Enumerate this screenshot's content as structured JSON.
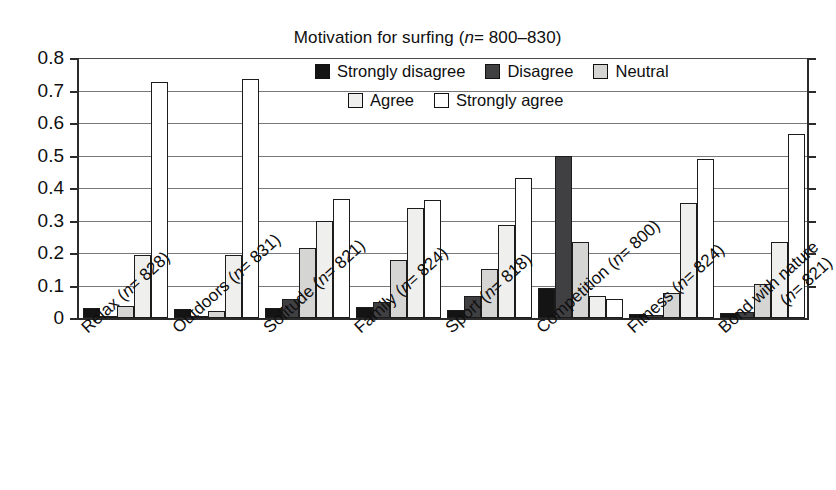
{
  "chart_data": {
    "type": "bar",
    "title_prefix": "Motivation for surfing (",
    "title_n": "n",
    "title_suffix": "= 800–830)",
    "xlabel": "",
    "ylabel": "",
    "ylim": [
      0,
      0.8
    ],
    "ytick_values": [
      0,
      0.1,
      0.2,
      0.3,
      0.4,
      0.5,
      0.6,
      0.7,
      0.8
    ],
    "ytick_labels": [
      "0",
      "0.1",
      "0.2",
      "0.3",
      "0.4",
      "0.5",
      "0.6",
      "0.7",
      "0.8"
    ],
    "grid": true,
    "grid_axis": "y",
    "legend_position": "upper right inside",
    "categories": [
      "Relax (n= 828)",
      "Outdoors (n= 831)",
      "Solitude (n= 821)",
      "Family (n= 824)",
      "Sport (n= 818)",
      "Competition (n= 800)",
      "Fitness (n= 824)",
      "Bond with nature (n= 821)"
    ],
    "category_parts": [
      {
        "name": "Relax",
        "n": "828",
        "line2": ""
      },
      {
        "name": "Outdoors",
        "n": "831",
        "line2": ""
      },
      {
        "name": "Solitude",
        "n": "821",
        "line2": ""
      },
      {
        "name": "Family",
        "n": "824",
        "line2": ""
      },
      {
        "name": "Sport",
        "n": "818",
        "line2": ""
      },
      {
        "name": "Competition",
        "n": "800",
        "line2": ""
      },
      {
        "name": "Fitness",
        "n": "824",
        "line2": ""
      },
      {
        "name": "Bond with nature",
        "n": "821",
        "line2": "wrapped"
      }
    ],
    "series": [
      {
        "name": "Strongly disagree",
        "color": "#141414",
        "values": [
          0.03,
          0.028,
          0.03,
          0.033,
          0.025,
          0.092,
          0.013,
          0.015
        ]
      },
      {
        "name": "Disagree",
        "color": "#404043",
        "values": [
          0.006,
          0.004,
          0.058,
          0.048,
          0.068,
          0.5,
          0.008,
          0.018
        ]
      },
      {
        "name": "Neutral",
        "color": "#d5d5d3",
        "values": [
          0.036,
          0.022,
          0.215,
          0.178,
          0.152,
          0.235,
          0.078,
          0.105
        ]
      },
      {
        "name": "Agree",
        "color": "#efefee",
        "values": [
          0.195,
          0.195,
          0.3,
          0.34,
          0.285,
          0.068,
          0.355,
          0.235
        ]
      },
      {
        "name": "Strongly agree",
        "color": "#ffffff",
        "values": [
          0.725,
          0.735,
          0.365,
          0.362,
          0.432,
          0.058,
          0.49,
          0.565
        ]
      }
    ]
  },
  "legend": {
    "rows": [
      [
        "Strongly disagree",
        "Disagree",
        "Neutral"
      ],
      [
        "Agree",
        "Strongly agree"
      ]
    ]
  },
  "axis": {
    "n_italic": "n",
    "eq": "=",
    "open_paren": "(",
    "close_paren": ")"
  }
}
